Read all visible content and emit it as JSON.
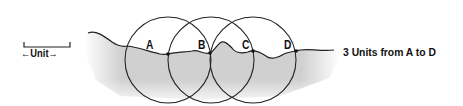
{
  "diagram": {
    "unit_label": "←Unit→",
    "caption": "3 Units from A to D",
    "points": [
      {
        "label": "A",
        "x": 152,
        "y": 38
      },
      {
        "label": "B",
        "x": 196,
        "y": 38
      },
      {
        "label": "C",
        "x": 240,
        "y": 38
      },
      {
        "label": "D",
        "x": 285,
        "y": 38
      }
    ],
    "circles": [
      {
        "cx": 168,
        "cy": 60,
        "r": 43
      },
      {
        "cx": 211,
        "cy": 60,
        "r": 43
      },
      {
        "cx": 253,
        "cy": 60,
        "r": 43
      }
    ],
    "colors": {
      "line": "#222222",
      "shading": "#c8c8c8",
      "background": "#ffffff"
    }
  }
}
